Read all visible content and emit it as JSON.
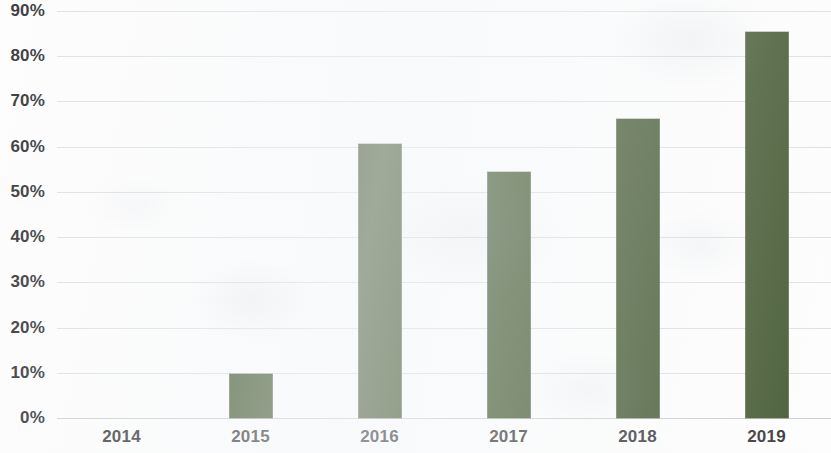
{
  "chart_data": {
    "type": "bar",
    "title": "",
    "subtitle": "",
    "xlabel": "",
    "ylabel": "",
    "categories": [
      "2014",
      "2015",
      "2016",
      "2017",
      "2018",
      "2019"
    ],
    "values": [
      0,
      9.8,
      60.7,
      54.3,
      66.2,
      85.3
    ],
    "value_format": "percent",
    "ylim": [
      0,
      90
    ],
    "ytick_step": 10,
    "ytick_labels": [
      "0%",
      "10%",
      "20%",
      "30%",
      "40%",
      "50%",
      "60%",
      "70%",
      "80%",
      "90%"
    ],
    "ytick_values": [
      0,
      10,
      20,
      30,
      40,
      50,
      60,
      70,
      80,
      90
    ],
    "grid": true,
    "grid_axis": "y",
    "legend": false,
    "legend_position": "none",
    "series": [
      {
        "name": "",
        "color": "#4a5e38",
        "values": [
          0,
          9.8,
          60.7,
          54.3,
          66.2,
          85.3
        ]
      }
    ],
    "colors": {
      "bar": "#4a5e38",
      "gridline": "#d8dade",
      "axis": "#c3c6ca",
      "tick_text": "#3b3b3d",
      "background": "#fdfdfd"
    }
  }
}
